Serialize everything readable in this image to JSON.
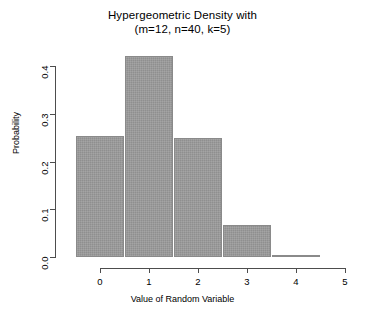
{
  "chart_data": {
    "type": "bar",
    "title": "Hypergeometric Density with",
    "subtitle": "(m=12, n=40, k=5)",
    "xlabel": "Value of Random Variable",
    "ylabel": "Probability",
    "categories": [
      "0",
      "1",
      "2",
      "3",
      "4"
    ],
    "x": [
      0,
      1,
      2,
      3,
      4
    ],
    "values": [
      0.2528,
      0.4213,
      0.2492,
      0.0664,
      0.0042
    ],
    "xlim": [
      0,
      5
    ],
    "ylim": [
      0.0,
      0.4
    ],
    "x_ticks": [
      "0",
      "1",
      "2",
      "3",
      "4",
      "5"
    ],
    "x_tick_values": [
      0,
      1,
      2,
      3,
      4,
      5
    ],
    "y_ticks": [
      "0.0",
      "0.1",
      "0.2",
      "0.3",
      "0.4"
    ],
    "y_tick_values": [
      0.0,
      0.1,
      0.2,
      0.3,
      0.4
    ],
    "grid": false,
    "legend": null,
    "bar_color": "#8f8f8f",
    "bar_border_color": "#8a8a8a",
    "axis_color": "#4d4d4d",
    "background": "#ffffff",
    "bar_width": 1.0
  }
}
